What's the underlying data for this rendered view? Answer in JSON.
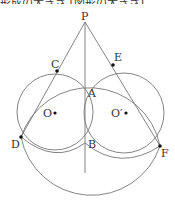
{
  "header": {
    "cropped_text": "形成の大きさ [図形の大きさ]"
  },
  "diagram": {
    "points": {
      "P": "P",
      "A": "A",
      "B": "B",
      "C": "C",
      "D": "D",
      "E": "E",
      "F": "F",
      "O": "O",
      "O2": "O′"
    },
    "stroke_color": "#777777",
    "point_color": "#111111"
  }
}
